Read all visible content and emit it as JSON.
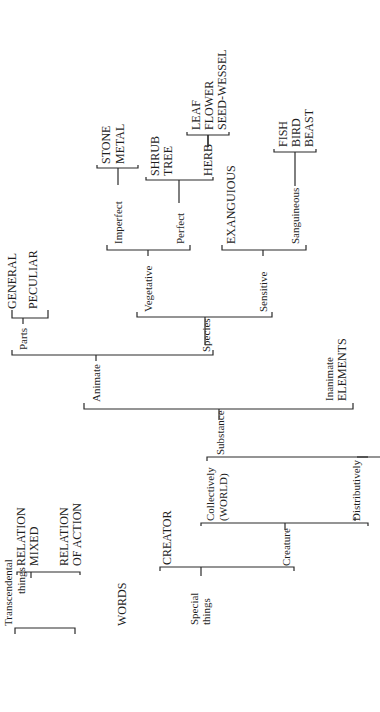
{
  "diagram": {
    "type": "hierarchical-bracket-tree",
    "orientation": "rotated-90-ccw",
    "root": "WORDS",
    "nodes": {
      "words": "WORDS",
      "transcendental": "Transcendental",
      "transcendental_2": "things",
      "relation_mixed_1": "RELATION",
      "relation_mixed_2": "MIXED",
      "relation_action_1": "RELATION",
      "relation_action_2": "OF ACTION",
      "special_1": "Special",
      "special_2": "things",
      "creator": "CREATOR",
      "creature": "Creature",
      "collectively": "Collectively",
      "world": "(WORLD)",
      "distributively": "Distributively",
      "substance": "Substance",
      "animate": "Animate",
      "inanimate": "Inanimate",
      "elements": "ELEMENTS",
      "parts": "Parts",
      "general": "GENERAL",
      "peculiar": "PECULIAR",
      "species": "Species",
      "vegetative": "Vegetative",
      "sensitive": "Sensitive",
      "imperfect": "Imperfect",
      "stone": "STONE",
      "metal": "METAL",
      "perfect": "Perfect",
      "shrub": "SHRUB",
      "tree": "TREE",
      "herb": "HERB",
      "leaf": "LEAF",
      "flower": "FLOWER",
      "seed_wessel": "SEED-WESSEL",
      "exanguious": "EXANGUIOUS",
      "sanguineous": "Sanguineous",
      "fish": "FISH",
      "bird": "BIRD",
      "beast": "BEAST"
    }
  }
}
